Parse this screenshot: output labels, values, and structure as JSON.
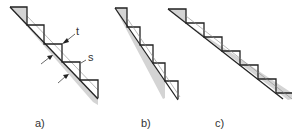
{
  "figure": {
    "panels": [
      {
        "id": "a",
        "caption": "a)",
        "steps": 5,
        "annotations": [
          "t",
          "s"
        ]
      },
      {
        "id": "b",
        "caption": "b)",
        "steps": 5
      },
      {
        "id": "c",
        "caption": "c)",
        "steps": 6
      }
    ],
    "annotation_labels": {
      "t": "t",
      "s": "s"
    }
  }
}
